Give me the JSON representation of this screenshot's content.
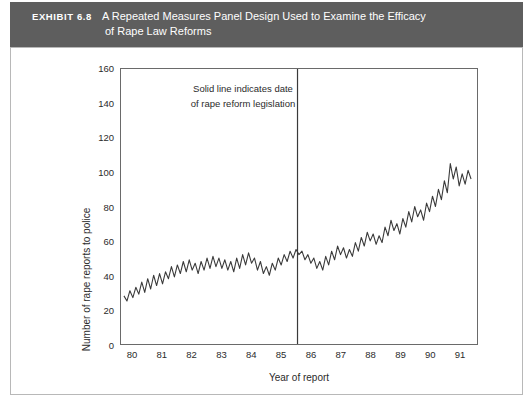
{
  "banner": {
    "exhibit_label": "EXHIBIT 6.8",
    "title_line1": "A Repeated Measures Panel Design Used to Examine the Efficacy",
    "title_line2": "of Rape Law Reforms",
    "background_color": "#5e5e5e",
    "text_color": "#ffffff"
  },
  "chart_data": {
    "type": "line",
    "title": "A Repeated Measures Panel Design Used to Examine the Efficacy of Rape Law Reforms",
    "xlabel": "Year of report",
    "ylabel": "Number of rape reports to police",
    "xlim": [
      79.6,
      91.6
    ],
    "ylim": [
      0,
      160
    ],
    "ytick_labels": [
      "0",
      "20",
      "40",
      "60",
      "80",
      "100",
      "120",
      "140",
      "160"
    ],
    "ytick_values": [
      0,
      20,
      40,
      60,
      80,
      100,
      120,
      140,
      160
    ],
    "xtick_labels": [
      "80",
      "81",
      "82",
      "83",
      "84",
      "85",
      "86",
      "87",
      "88",
      "89",
      "90",
      "91"
    ],
    "xtick_values": [
      80,
      81,
      82,
      83,
      84,
      85,
      86,
      87,
      88,
      89,
      90,
      91
    ],
    "grid": false,
    "legend": "none",
    "line_color": "#3a3a3a",
    "annotations": [
      {
        "text": "Solid line indicates date\nof rape reform legislation",
        "x": 81.1,
        "y": 140
      }
    ],
    "reference_line": {
      "orientation": "vertical",
      "x": 85.55,
      "label": "date of rape reform legislation",
      "color": "#3a3a3a"
    },
    "series": [
      {
        "name": "Number of rape reports to police",
        "x": [
          79.7,
          79.8,
          79.9,
          80.0,
          80.1,
          80.2,
          80.3,
          80.4,
          80.5,
          80.6,
          80.7,
          80.8,
          80.9,
          81.0,
          81.1,
          81.2,
          81.3,
          81.4,
          81.5,
          81.6,
          81.7,
          81.8,
          81.9,
          82.0,
          82.1,
          82.2,
          82.3,
          82.4,
          82.5,
          82.6,
          82.7,
          82.8,
          82.9,
          83.0,
          83.1,
          83.2,
          83.3,
          83.4,
          83.5,
          83.6,
          83.7,
          83.8,
          83.9,
          84.0,
          84.1,
          84.2,
          84.3,
          84.4,
          84.5,
          84.6,
          84.7,
          84.8,
          84.9,
          85.0,
          85.1,
          85.2,
          85.3,
          85.4,
          85.5,
          85.6,
          85.7,
          85.8,
          85.9,
          86.0,
          86.1,
          86.2,
          86.3,
          86.4,
          86.5,
          86.6,
          86.7,
          86.8,
          86.9,
          87.0,
          87.1,
          87.2,
          87.3,
          87.4,
          87.5,
          87.6,
          87.7,
          87.8,
          87.9,
          88.0,
          88.1,
          88.2,
          88.3,
          88.4,
          88.5,
          88.6,
          88.7,
          88.8,
          88.9,
          89.0,
          89.1,
          89.2,
          89.3,
          89.4,
          89.5,
          89.6,
          89.7,
          89.8,
          89.9,
          90.0,
          90.1,
          90.2,
          90.3,
          90.4,
          90.5,
          90.6,
          90.7,
          90.8,
          90.9,
          91.0,
          91.1,
          91.2,
          91.3,
          91.4
        ],
        "values": [
          28,
          25,
          31,
          27,
          33,
          29,
          36,
          30,
          38,
          32,
          40,
          34,
          41,
          35,
          42,
          38,
          45,
          39,
          46,
          41,
          48,
          42,
          49,
          43,
          47,
          41,
          48,
          43,
          50,
          44,
          51,
          45,
          50,
          44,
          49,
          43,
          48,
          42,
          50,
          44,
          52,
          46,
          53,
          47,
          50,
          43,
          48,
          41,
          45,
          40,
          47,
          43,
          50,
          46,
          52,
          48,
          54,
          50,
          55,
          52,
          54,
          49,
          52,
          47,
          50,
          44,
          48,
          43,
          51,
          46,
          54,
          49,
          57,
          52,
          56,
          50,
          55,
          51,
          59,
          54,
          62,
          57,
          65,
          60,
          64,
          58,
          63,
          59,
          68,
          63,
          72,
          66,
          70,
          64,
          73,
          68,
          77,
          71,
          80,
          74,
          78,
          72,
          82,
          77,
          86,
          80,
          90,
          84,
          95,
          88,
          105,
          96,
          103,
          92,
          99,
          93,
          101,
          96
        ]
      }
    ]
  },
  "plot": {
    "frame_color": "#6a6a6a",
    "background": "#ffffff"
  },
  "figure_frame": {
    "border_color": "#b8b8b8"
  }
}
